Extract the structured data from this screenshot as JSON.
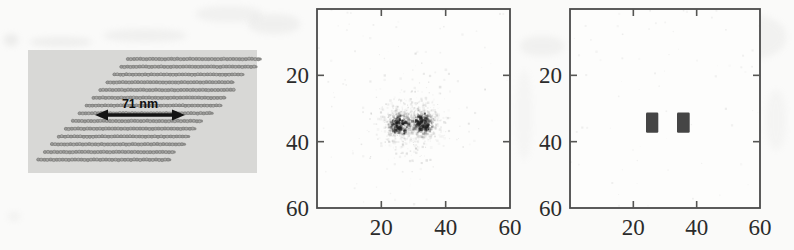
{
  "figure": {
    "background": "#fafaf9",
    "plot_bg": "#fdfdfc",
    "border_color": "#4a4a4a",
    "tick_color": "#555553",
    "tick_label_color": "#2b2b2b",
    "speck_color": "#1c1c1c"
  },
  "schematic": {
    "panel_bg": "#d8d8d6",
    "row_line_color": "#8d8d8b",
    "particle_fill": "#a8a8a6",
    "particle_fill_alt": "#9b9b99",
    "particle_outline": "#767674",
    "rows": 14,
    "scale_label": "71 nm",
    "arrow_color": "#141414",
    "noise_seed": 3
  },
  "chart_data": [
    {
      "id": "measured",
      "type": "heatmap",
      "title": "",
      "xlabel": "",
      "ylabel": "",
      "xlim": [
        0,
        60
      ],
      "ylim": [
        0,
        60
      ],
      "y_direction": "down",
      "grid": false,
      "x_tick_labels": [
        "20",
        "40",
        "60"
      ],
      "y_tick_labels": [
        "20",
        "40",
        "60"
      ],
      "content": "noisy speckled localization cloud with two dense dark peaks",
      "peaks": [
        {
          "x": 25.5,
          "y": 34.5,
          "sigma": 2.9,
          "points": 430
        },
        {
          "x": 32.5,
          "y": 34.2,
          "sigma": 2.9,
          "points": 430
        }
      ],
      "halo": {
        "x": 29.0,
        "y": 34.5,
        "sigma": 6.8,
        "points": 280
      },
      "background_specks": 90,
      "noise_seed": 12
    },
    {
      "id": "resolved",
      "type": "heatmap",
      "title": "",
      "xlabel": "",
      "ylabel": "",
      "xlim": [
        0,
        60
      ],
      "ylim": [
        0,
        60
      ],
      "y_direction": "down",
      "grid": false,
      "x_tick_labels": [
        "20",
        "40",
        "60"
      ],
      "y_tick_labels": [
        "20",
        "40",
        "60"
      ],
      "content": "two resolved square features",
      "rects": [
        {
          "x": 24.0,
          "y": 31.2,
          "w": 3.9,
          "h": 6.1,
          "color": "#3b3b3b"
        },
        {
          "x": 33.8,
          "y": 31.2,
          "w": 4.0,
          "h": 6.1,
          "color": "#3b3b3b"
        }
      ],
      "background_specks": 70,
      "noise_seed": 5
    }
  ],
  "artifacts": [
    {
      "x": 4,
      "y": 34,
      "w": 14,
      "h": 12,
      "o": 0.2
    },
    {
      "x": 30,
      "y": 37,
      "w": 62,
      "h": 10,
      "o": 0.16
    },
    {
      "x": 104,
      "y": 29,
      "w": 82,
      "h": 13,
      "o": 0.14
    },
    {
      "x": 196,
      "y": 6,
      "w": 66,
      "h": 16,
      "o": 0.13
    },
    {
      "x": 248,
      "y": 14,
      "w": 52,
      "h": 20,
      "o": 0.14
    },
    {
      "x": 345,
      "y": 21,
      "w": 60,
      "h": 12,
      "o": 0.08
    },
    {
      "x": 520,
      "y": 36,
      "w": 44,
      "h": 20,
      "o": 0.13
    },
    {
      "x": 516,
      "y": 70,
      "w": 16,
      "h": 90,
      "o": 0.07
    },
    {
      "x": 698,
      "y": 14,
      "w": 88,
      "h": 46,
      "o": 0.12
    },
    {
      "x": 766,
      "y": 90,
      "w": 20,
      "h": 60,
      "o": 0.08
    },
    {
      "x": 585,
      "y": 80,
      "w": 150,
      "h": 10,
      "o": 0.05
    },
    {
      "x": 585,
      "y": 118,
      "w": 150,
      "h": 12,
      "o": 0.05
    },
    {
      "x": 590,
      "y": 150,
      "w": 140,
      "h": 10,
      "o": 0.05
    },
    {
      "x": 8,
      "y": 212,
      "w": 12,
      "h": 9,
      "o": 0.12
    }
  ]
}
